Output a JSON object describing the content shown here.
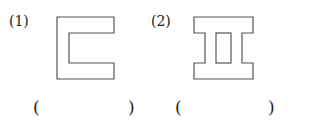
{
  "problems": [
    {
      "label": "(1)",
      "shape": "c-shape",
      "answer_open": "(",
      "answer_close": ")"
    },
    {
      "label": "(2)",
      "shape": "i-beam-with-slot",
      "answer_open": "(",
      "answer_close": ")"
    }
  ]
}
